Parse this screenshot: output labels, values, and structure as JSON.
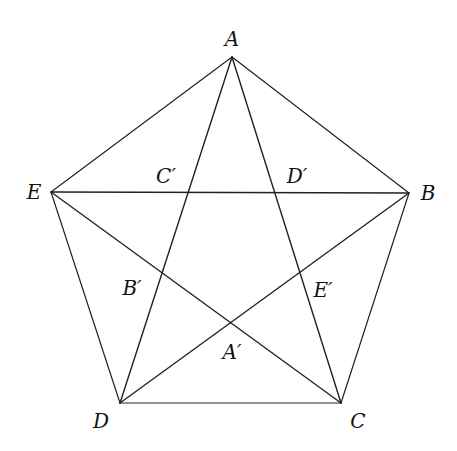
{
  "diagram": {
    "type": "regular pentagon with inscribed pentagram",
    "outer_vertices": [
      {
        "id": "A",
        "label": "A"
      },
      {
        "id": "B",
        "label": "B"
      },
      {
        "id": "C",
        "label": "C"
      },
      {
        "id": "D",
        "label": "D"
      },
      {
        "id": "E",
        "label": "E"
      }
    ],
    "inner_points": [
      {
        "id": "A'",
        "label": "A′"
      },
      {
        "id": "B'",
        "label": "B′"
      },
      {
        "id": "C'",
        "label": "C′"
      },
      {
        "id": "D'",
        "label": "D′"
      },
      {
        "id": "E'",
        "label": "E′"
      }
    ],
    "pentagon_edges": [
      [
        "A",
        "B"
      ],
      [
        "B",
        "C"
      ],
      [
        "C",
        "D"
      ],
      [
        "D",
        "E"
      ],
      [
        "E",
        "A"
      ]
    ],
    "diagonals": [
      [
        "A",
        "C"
      ],
      [
        "A",
        "D"
      ],
      [
        "B",
        "D"
      ],
      [
        "B",
        "E"
      ],
      [
        "C",
        "E"
      ]
    ],
    "line_color": "#222222"
  }
}
